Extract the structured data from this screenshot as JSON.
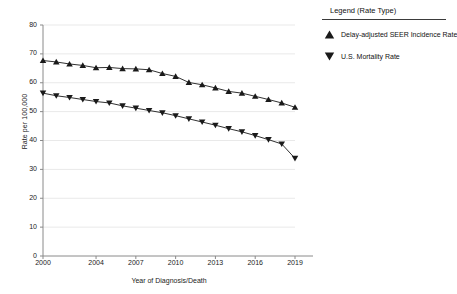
{
  "chart_data": {
    "type": "line",
    "title": "",
    "xlabel": "Year of Diagnosis/Death",
    "ylabel": "Rate per 100,000",
    "x": [
      2000,
      2001,
      2002,
      2003,
      2004,
      2005,
      2006,
      2007,
      2008,
      2009,
      2010,
      2011,
      2012,
      2013,
      2014,
      2015,
      2016,
      2017,
      2018,
      2019
    ],
    "xtick_labels": [
      "2000",
      "2004",
      "2007",
      "2010",
      "2013",
      "2016",
      "2019"
    ],
    "xtick_values": [
      2000,
      2004,
      2007,
      2010,
      2013,
      2016,
      2019
    ],
    "ytick_labels": [
      "0",
      "10",
      "20",
      "30",
      "40",
      "50",
      "60",
      "70",
      "80"
    ],
    "ytick_values": [
      0,
      10,
      20,
      30,
      40,
      50,
      60,
      70,
      80
    ],
    "xlim": [
      2000,
      2019
    ],
    "ylim": [
      0,
      80
    ],
    "grid": true,
    "legend_position": "right",
    "series": [
      {
        "name": "Delay-adjusted SEER Incidence Rate",
        "marker": "triangle-up",
        "color": "#1a1a1a",
        "values": [
          67.7,
          67.2,
          66.5,
          66.0,
          65.2,
          65.3,
          64.9,
          64.8,
          64.5,
          63.2,
          62.2,
          60.1,
          59.3,
          58.2,
          57.0,
          56.4,
          55.3,
          54.2,
          53.0,
          51.5
        ]
      },
      {
        "name": "U.S. Mortality Rate",
        "marker": "triangle-down",
        "color": "#1a1a1a",
        "values": [
          56.4,
          55.5,
          54.9,
          54.2,
          53.5,
          53.0,
          52.0,
          51.2,
          50.4,
          49.6,
          48.6,
          47.5,
          46.4,
          45.3,
          44.1,
          43.0,
          41.7,
          40.3,
          38.8,
          33.8
        ]
      }
    ]
  },
  "legend": {
    "title": "Legend (Rate Type)",
    "entries": [
      {
        "label": "Delay-adjusted SEER Incidence Rate",
        "marker": "triangle-up-icon"
      },
      {
        "label": "U.S. Mortality Rate",
        "marker": "triangle-down-icon"
      }
    ]
  }
}
